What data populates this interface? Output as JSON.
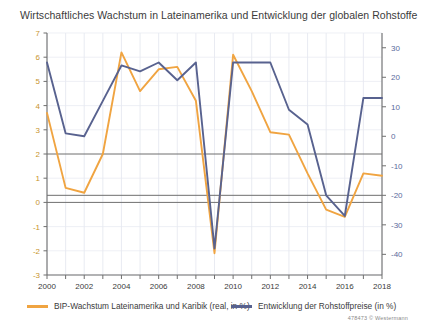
{
  "chart_data": {
    "type": "line",
    "title": "Wirtschaftliches Wachstum in Lateinamerika und Entwicklung der globalen Rohstoffe",
    "xlabel": "",
    "ylabel": "",
    "grid": true,
    "legend_position": "bottom",
    "x": [
      2000,
      2001,
      2002,
      2003,
      2004,
      2005,
      2006,
      2007,
      2008,
      2009,
      2010,
      2011,
      2012,
      2013,
      2014,
      2015,
      2016,
      2017,
      2018
    ],
    "xtick_labels": [
      "2000",
      "",
      "2002",
      "",
      "2004",
      "",
      "2006",
      "",
      "2008",
      "",
      "2010",
      "",
      "2012",
      "",
      "2014",
      "",
      "2016",
      "",
      "2018"
    ],
    "xlim": [
      2000,
      2018
    ],
    "axes": [
      {
        "id": "left",
        "name": "BIP-Wachstum (real, in %)",
        "ylim": [
          -3,
          7
        ],
        "yticks": [
          -3,
          -2,
          -1,
          0,
          1,
          2,
          3,
          4,
          5,
          6,
          7
        ],
        "ytick_labels": [
          "-3",
          "-2",
          "-1",
          "0",
          "1",
          "2",
          "3",
          "4",
          "5",
          "6",
          "7"
        ],
        "tick_color": "#c8952f"
      },
      {
        "id": "right",
        "name": "Rohstoffpreise (in %)",
        "ylim": [
          -47,
          35
        ],
        "yticks": [
          -40,
          -30,
          -20,
          -10,
          0,
          10,
          20,
          30
        ],
        "ytick_labels": [
          "-40",
          "-30",
          "-20",
          "-10",
          "0",
          "10",
          "20",
          "30"
        ],
        "tick_color": "#5a6b9c"
      }
    ],
    "series": [
      {
        "name": "BIP-Wachstum Lateinamerika und Karibik (real, in %)",
        "axis": "left",
        "color": "#f0a441",
        "values": [
          3.7,
          0.6,
          0.4,
          2.0,
          6.2,
          4.6,
          5.5,
          5.6,
          4.2,
          -2.1,
          6.1,
          4.6,
          2.9,
          2.8,
          1.2,
          -0.3,
          -0.6,
          1.2,
          1.1
        ]
      },
      {
        "name": "Entwicklung der Rohstoffpreise (in %)",
        "axis": "right",
        "color": "#58628f",
        "values": [
          25,
          1,
          0,
          12,
          24,
          22,
          25,
          19,
          25,
          -38,
          25,
          25,
          25,
          9,
          4,
          -20,
          -27,
          13,
          13
        ]
      }
    ]
  },
  "legend": {
    "items": [
      {
        "label": "BIP-Wachstum Lateinamerika und Karibik (real, in %)",
        "color": "#f0a441"
      },
      {
        "label": "Entwicklung der Rohstoffpreise (in %)",
        "color": "#58628f"
      }
    ]
  },
  "credit": "478473  © Westermann"
}
